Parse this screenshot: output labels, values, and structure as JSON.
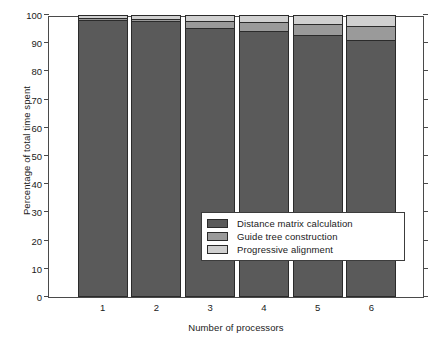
{
  "chart_data": {
    "type": "bar",
    "subtype": "stacked-bar-percent",
    "title": "",
    "xlabel": "Number of processors",
    "ylabel": "Percentage of total time spent",
    "categories": [
      "1",
      "2",
      "3",
      "4",
      "5",
      "6"
    ],
    "xtick_labels": [
      "1",
      "2",
      "3",
      "4",
      "5",
      "6"
    ],
    "ytick_labels": [
      "0",
      "10",
      "20",
      "30",
      "40",
      "50",
      "60",
      "70",
      "80",
      "90",
      "100"
    ],
    "ytick_values": [
      0,
      10,
      20,
      30,
      40,
      50,
      60,
      70,
      80,
      90,
      100
    ],
    "ylim": [
      0,
      100
    ],
    "grid": false,
    "legend_position": "inside-lower-right",
    "series": [
      {
        "name": "Distance matrix calculation",
        "color": "#5a5a5a",
        "values": [
          98.3,
          97.8,
          95.5,
          94.3,
          93.0,
          91.2
        ]
      },
      {
        "name": "Guide tree construction",
        "color": "#9a9a9a",
        "values": [
          0.7,
          0.9,
          2.5,
          3.2,
          3.8,
          4.8
        ]
      },
      {
        "name": "Progressive alignment",
        "color": "#d0d0d0",
        "values": [
          1.0,
          1.3,
          2.0,
          2.5,
          3.2,
          4.0
        ]
      }
    ]
  },
  "legend": {
    "items": [
      {
        "label": "Distance matrix calculation",
        "color": "#5a5a5a"
      },
      {
        "label": "Guide tree construction",
        "color": "#9a9a9a"
      },
      {
        "label": "Progressive alignment",
        "color": "#d0d0d0"
      }
    ]
  },
  "axes": {
    "y_title": "Percentage of total time spent",
    "x_title": "Number of processors"
  }
}
